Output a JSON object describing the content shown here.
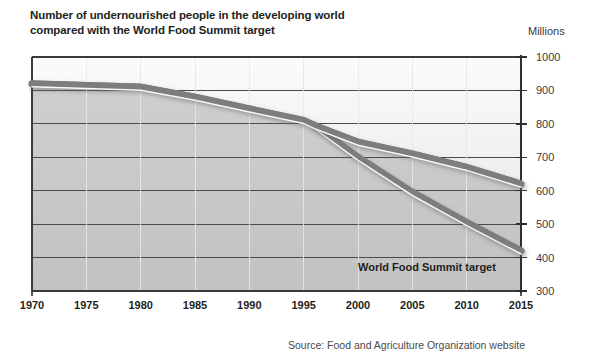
{
  "title": {
    "line1": "Number of undernourished people in the developing world",
    "line2": "compared with the World Food Summit target"
  },
  "units_label": "Millions",
  "source": "Source: Food and Agriculture Organization website",
  "annotation": "World Food Summit target",
  "colors": {
    "line": "#7d7d7d",
    "line_highlight": "#ffffff",
    "plot_fill_lower": "#c6c6c6",
    "plot_fill_upper": "#f4f4f4",
    "axis": "#3a3a3a",
    "gridline": "#4a4a4a",
    "text": "#231f20"
  },
  "chart_data": {
    "type": "line",
    "title": "Number of undernourished people in the developing world compared with the World Food Summit target",
    "xlabel": "",
    "ylabel": "Millions",
    "xlim": [
      1970,
      2015
    ],
    "ylim": [
      300,
      1000
    ],
    "xticks": [
      1970,
      1975,
      1980,
      1985,
      1990,
      1995,
      2000,
      2005,
      2010,
      2015
    ],
    "yticks": [
      300,
      400,
      500,
      600,
      700,
      800,
      900,
      1000
    ],
    "grid": true,
    "legend": "none",
    "annotations": [
      {
        "text": "World Food Summit target",
        "x": 2003,
        "y": 430
      }
    ],
    "series": [
      {
        "name": "Undernourished people (actual / projected)",
        "x": [
          1970,
          1975,
          1980,
          1985,
          1990,
          1995,
          1996,
          2000,
          2005,
          2010,
          2015
        ],
        "values": [
          920,
          915,
          910,
          880,
          845,
          810,
          795,
          745,
          710,
          670,
          620
        ]
      },
      {
        "name": "World Food Summit target",
        "x": [
          1996,
          2000,
          2005,
          2010,
          2015
        ],
        "values": [
          795,
          700,
          595,
          505,
          420
        ]
      }
    ]
  }
}
